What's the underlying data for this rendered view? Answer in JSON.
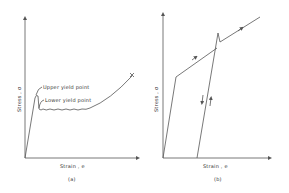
{
  "figure": {
    "panel_a": {
      "caption": "(a)",
      "x_axis_label": "Strain , e",
      "y_axis_label": "Stress , σ",
      "annotations": {
        "upper_yield": "Upper yield point",
        "lower_yield": "Lower yield point",
        "fracture_mark": "x"
      }
    },
    "panel_b": {
      "caption": "(b)",
      "x_axis_label": "Strain , e",
      "y_axis_label": "Stress , σ"
    },
    "colors": {
      "line": "#555555",
      "text": "#333333",
      "background": "#ffffff"
    }
  }
}
